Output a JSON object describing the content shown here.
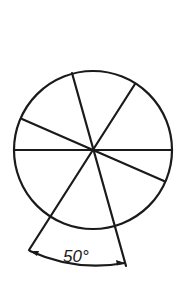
{
  "diagram": {
    "type": "circle-sectors",
    "circle": {
      "cx": 93,
      "cy": 150,
      "r": 79
    },
    "spokes": [
      {
        "name": "horizontal",
        "x1": 14,
        "y1": 150,
        "x2": 172,
        "y2": 150
      },
      {
        "name": "steep",
        "x1": 72,
        "y1": 73,
        "x2": 126,
        "y2": 266
      },
      {
        "name": "diagonal",
        "x1": 135,
        "y1": 84,
        "x2": 29,
        "y2": 250
      },
      {
        "name": "shallow",
        "x1": 22,
        "y1": 119,
        "x2": 164,
        "y2": 181
      }
    ],
    "angle_annotation": {
      "label": "50°",
      "value_degrees": 50
    },
    "stroke_color": "#1a1a1a",
    "background": "#ffffff"
  }
}
